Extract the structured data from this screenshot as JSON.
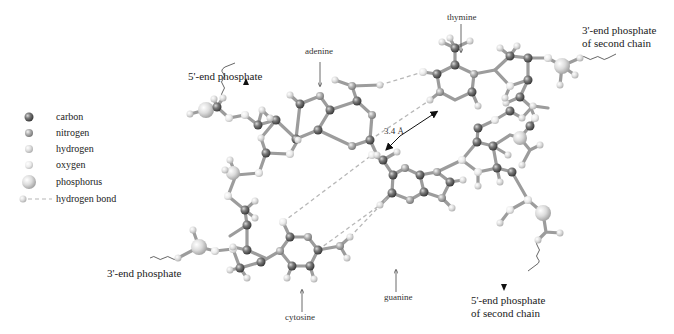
{
  "diagram": {
    "labels": {
      "five_end_phosphate": "5'-end phosphate",
      "adenine": "adenine",
      "thymine": "thymine",
      "three_end_second_line1": "3'-end phosphate",
      "three_end_second_line2": "of second chain",
      "distance": "3.4 Å",
      "guanine": "guanine",
      "cytosine": "cytosine",
      "three_end_phosphate": "3'-end phosphate",
      "five_end_second_line1": "5'-end phosphate",
      "five_end_second_line2": "of second chain"
    },
    "legend": {
      "items": [
        {
          "key": "carbon",
          "label": "carbon",
          "color": "#6f6f6f",
          "size": "small"
        },
        {
          "key": "nitrogen",
          "label": "nitrogen",
          "color": "#a6a6a6",
          "size": "small"
        },
        {
          "key": "hydrogen",
          "label": "hydrogen",
          "color": "#d4d4d4",
          "size": "small"
        },
        {
          "key": "oxygen",
          "label": "oxygen",
          "color": "#e6e6e6",
          "size": "small"
        },
        {
          "key": "phosphorus",
          "label": "phosphorus",
          "color": "#d0d0d0",
          "size": "large"
        },
        {
          "key": "hydrogen_bond",
          "label": "hydrogen bond",
          "color": "#bbbbbb",
          "size": "dashed"
        }
      ]
    },
    "colors": {
      "bond": "#9a9a9a",
      "hbond": "#b5b5b5",
      "carbon": "#6f6f6f",
      "nitrogen": "#a8a8a8",
      "hydrogen": "#d8d8d8",
      "oxygen": "#e8e8e8",
      "phosphorus": "#d2d2d2"
    }
  }
}
